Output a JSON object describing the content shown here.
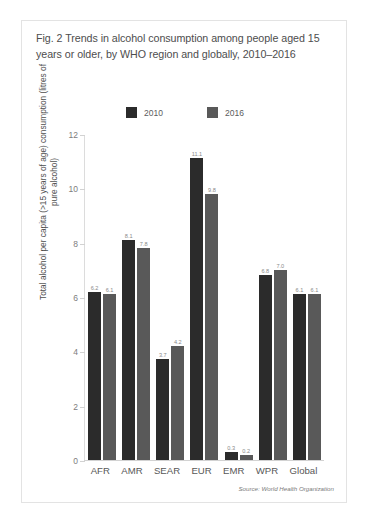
{
  "figure": {
    "title": "Fig. 2 Trends in alcohol consumption among people aged 15 years or older, by WHO region and globally, 2010–2016",
    "source": "Source: World Health Organization",
    "y_axis_title": "Total alcohol per capita (>15 years of age) consumption (litres of pure alcohol)"
  },
  "legend": {
    "items": [
      {
        "label": "2010",
        "color": "#2b2b2b"
      },
      {
        "label": "2016",
        "color": "#595959"
      }
    ]
  },
  "chart_data": {
    "type": "bar",
    "title": "Fig. 2 Trends in alcohol consumption among people aged 15 years or older, by WHO region and globally, 2010–2016",
    "xlabel": "",
    "ylabel": "Total alcohol per capita (>15 years of age) consumption (litres of pure alcohol)",
    "categories": [
      "AFR",
      "AMR",
      "SEAR",
      "EUR",
      "EMR",
      "WPR",
      "Global"
    ],
    "series": [
      {
        "name": "2010",
        "color": "#2b2b2b",
        "values": [
          6.2,
          8.1,
          3.7,
          11.1,
          0.3,
          6.8,
          6.1
        ]
      },
      {
        "name": "2016",
        "color": "#595959",
        "values": [
          6.1,
          7.8,
          4.2,
          9.8,
          0.2,
          7.0,
          6.1
        ]
      }
    ],
    "ylim": [
      0,
      12
    ],
    "yticks": [
      0,
      2,
      4,
      6,
      8,
      10,
      12
    ],
    "ytick_labels": [
      "0",
      "2",
      "4",
      "6",
      "8",
      "10",
      "12"
    ],
    "grid": false,
    "legend_position": "top-center",
    "data_labels": [
      [
        "6.2",
        "6.1"
      ],
      [
        "8.1",
        "7.8"
      ],
      [
        "3.7",
        "4.2"
      ],
      [
        "11.1",
        "9.8"
      ],
      [
        "0.3",
        "0.2"
      ],
      [
        "6.8",
        "7.0"
      ],
      [
        "6.1",
        "6.1"
      ]
    ],
    "source": "Source: World Health Organization"
  }
}
